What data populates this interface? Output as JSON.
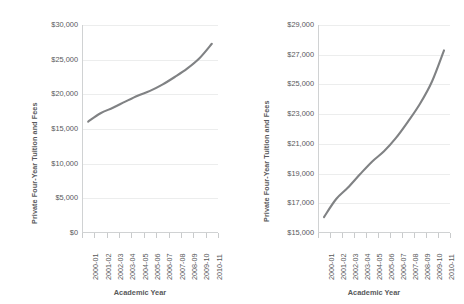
{
  "chart_data": [
    {
      "id": "left",
      "type": "line",
      "title": "",
      "xlabel": "Academic Year",
      "ylabel": "Private Four-Year Tuition and Fees",
      "categories": [
        "2000-01",
        "2001-02",
        "2002-03",
        "2003-04",
        "2004-05",
        "2005-06",
        "2006-07",
        "2007-08",
        "2008-09",
        "2009-10",
        "2010-11"
      ],
      "values": [
        16072,
        17272,
        18060,
        18950,
        19800,
        20500,
        21400,
        22500,
        23700,
        25200,
        27293
      ],
      "ylim": [
        0,
        30000
      ],
      "yticks": [
        0,
        5000,
        10000,
        15000,
        20000,
        25000,
        30000
      ],
      "ytick_labels": [
        "$0",
        "$5,000",
        "$10,000",
        "$15,000",
        "$20,000",
        "$25,000",
        "$30,000"
      ],
      "grid": true,
      "legend": "none",
      "series_color": "#808284"
    },
    {
      "id": "right",
      "type": "line",
      "title": "",
      "xlabel": "Academic Year",
      "ylabel": "Private Four-Year Tuition and Fees",
      "categories": [
        "2000-01",
        "2001-02",
        "2002-03",
        "2003-04",
        "2004-05",
        "2005-06",
        "2006-07",
        "2007-08",
        "2008-09",
        "2009-10",
        "2010-11"
      ],
      "values": [
        16072,
        17272,
        18060,
        18950,
        19800,
        20500,
        21400,
        22500,
        23700,
        25200,
        27293
      ],
      "ylim": [
        15000,
        29000
      ],
      "yticks": [
        15000,
        17000,
        19000,
        21000,
        23000,
        25000,
        27000,
        29000
      ],
      "ytick_labels": [
        "$15,000",
        "$17,000",
        "$19,000",
        "$21,000",
        "$23,000",
        "$25,000",
        "$27,000",
        "$29,000"
      ],
      "grid": true,
      "legend": "none",
      "series_color": "#808284"
    }
  ]
}
